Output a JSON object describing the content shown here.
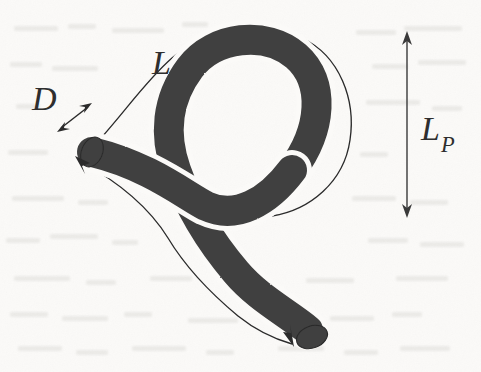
{
  "figure": {
    "kind": "scanned-line-drawing",
    "caption_text": "",
    "background_color": "#fbfaf8",
    "ink_color": "#3f3f3f",
    "outline_color": "#2b2b2b",
    "labels": [
      {
        "id": "arclength",
        "text": "L",
        "subscript": "",
        "x": 152,
        "y": 74,
        "font_size": 34
      },
      {
        "id": "diameter",
        "text": "D",
        "subscript": "",
        "x": 32,
        "y": 110,
        "font_size": 34
      },
      {
        "id": "projected-length",
        "text": "L",
        "subscript": "P",
        "x": 421,
        "y": 140,
        "font_size": 34
      }
    ],
    "annotations": {
      "diameter_arrow": {
        "name": "double-headed-arrow",
        "x1": 58,
        "y1": 131,
        "x2": 91,
        "y2": 104
      },
      "projected_length_arrow": {
        "name": "vertical-double-headed-arrow",
        "x": 407,
        "y1": 33,
        "y2": 216
      },
      "contour_arrow_start": {
        "name": "arrowhead-up-left",
        "x": 76,
        "y": 157
      },
      "contour_arrow_end": {
        "name": "arrowhead-down-right",
        "x": 295,
        "y": 344
      }
    },
    "geometry": {
      "tube_width": 30,
      "loop_center": {
        "x": 262,
        "y": 118
      },
      "loop_rx": 88,
      "loop_ry": 82,
      "free_end_upper_left": {
        "x": 92,
        "y": 152
      },
      "free_end_lower_right": {
        "x": 315,
        "y": 344
      }
    },
    "noise": {
      "description": "faint bleed-through ghost text from reverse page",
      "opacity": 0.055,
      "color": "#8e8a84"
    }
  }
}
